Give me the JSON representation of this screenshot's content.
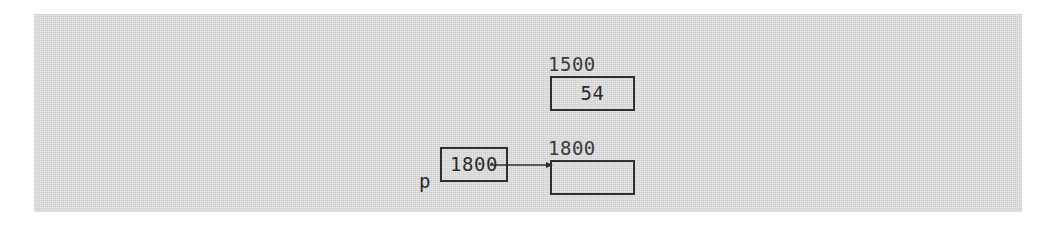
{
  "diagram": {
    "type": "pointer-memory-diagram",
    "panel_background": "#d7d7d7",
    "page_background": "#ffffff",
    "stroke_color": "#2e2e2e",
    "nodes": [
      {
        "id": "heap-cell-1500",
        "address_label": "1500",
        "value": "54",
        "empty": false
      },
      {
        "id": "heap-cell-1800",
        "address_label": "1800",
        "value": "",
        "empty": true
      },
      {
        "id": "pointer-variable-p",
        "variable_label": "p",
        "value": "1800",
        "empty": false
      }
    ],
    "edges": [
      {
        "id": "p-to-1800",
        "from": "pointer-variable-p",
        "to": "heap-cell-1800",
        "style": "solid-arrow",
        "head": "filled-triangle"
      }
    ]
  }
}
